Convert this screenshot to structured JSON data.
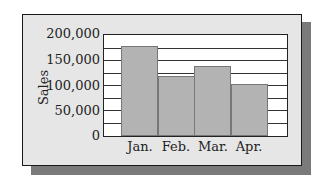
{
  "chart_data": {
    "type": "bar",
    "title": "",
    "xlabel": "",
    "ylabel": "Sales",
    "categories": [
      "Jan.",
      "Feb.",
      "Mar.",
      "Apr."
    ],
    "values": [
      180000,
      120000,
      140000,
      105000
    ],
    "ylim": [
      0,
      200000
    ],
    "yticks": [
      "0",
      "50,000",
      "100,000",
      "150,000",
      "200,000"
    ],
    "gridlines_every": 25000,
    "grid": true,
    "legend": "none",
    "bar_color": "#b3b3b3"
  }
}
